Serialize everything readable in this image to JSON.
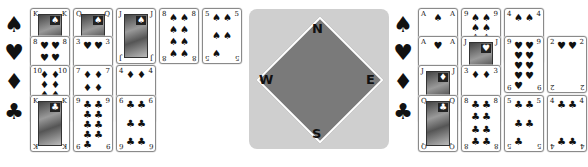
{
  "colors": {
    "compass_bg": "#cfcfcf",
    "compass_diamond": "#7a7a7a",
    "card_border": "#8a8a8a"
  },
  "suit_icons": {
    "spades": "♠",
    "hearts": "♥",
    "diamonds": "♦",
    "clubs": "♣"
  },
  "compass": {
    "north": "N",
    "south": "S",
    "east": "E",
    "west": "W"
  },
  "west_hand": {
    "rows": [
      {
        "suit": "spades",
        "symbol": "♠",
        "cards": [
          "K",
          "Q",
          "J",
          "8",
          "5"
        ]
      },
      {
        "suit": "hearts",
        "symbol": "♥",
        "cards": [
          "8",
          "3"
        ]
      },
      {
        "suit": "diamonds",
        "symbol": "♦",
        "cards": [
          "10",
          "7",
          "4"
        ]
      },
      {
        "suit": "clubs",
        "symbol": "♣",
        "cards": [
          "K",
          "9",
          "6"
        ]
      }
    ]
  },
  "east_hand": {
    "rows": [
      {
        "suit": "spades",
        "symbol": "♠",
        "cards": [
          "A",
          "9",
          "4"
        ]
      },
      {
        "suit": "hearts",
        "symbol": "♥",
        "cards": [
          "A",
          "J",
          "9",
          "2"
        ]
      },
      {
        "suit": "diamonds",
        "symbol": "♦",
        "cards": [
          "J",
          "3"
        ]
      },
      {
        "suit": "clubs",
        "symbol": "♣",
        "cards": [
          "Q",
          "8",
          "5",
          "4"
        ]
      }
    ]
  }
}
